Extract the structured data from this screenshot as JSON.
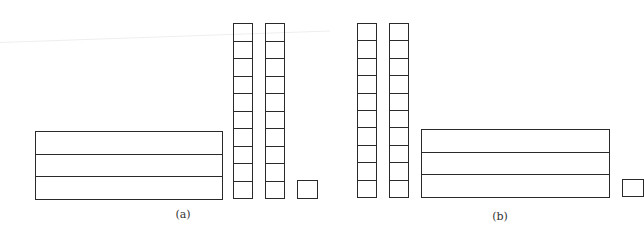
{
  "figure": {
    "panels": [
      {
        "label": "(a)",
        "flats": 1,
        "flat_rows": 3,
        "rods": 2,
        "rod_cells": 10,
        "units": 1
      },
      {
        "label": "(b)",
        "flats": 1,
        "flat_rows": 3,
        "rods": 2,
        "rod_cells": 10,
        "units": 1
      }
    ],
    "line_color": "#2a2a2a"
  }
}
